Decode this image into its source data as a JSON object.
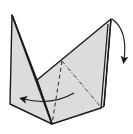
{
  "diagram": {
    "type": "origami-fold-step",
    "colors": {
      "background": "#ffffff",
      "paper_fill": "#dcdcdc",
      "edge_stroke": "#1a1a1a",
      "crease_stroke": "#2a2a2a",
      "arrow_stroke": "#1a1a1a"
    },
    "elements": {
      "left_flap": {
        "points": "12,15 10,104 52,124 37,80"
      },
      "body": {
        "points": "37,80 111,19 104,106 101,108 52,124"
      },
      "right_edge_back": {
        "points": "111,19 104,106"
      },
      "right_edge_front": {
        "points": "108,24 101,108"
      },
      "valley_fold_line": {
        "x1": 62,
        "y1": 61,
        "x2": 52,
        "y2": 124,
        "style": "dashed"
      },
      "mountain_fold_line": {
        "x1": 62,
        "y1": 61,
        "x2": 100,
        "y2": 106,
        "style": "dash-dot"
      },
      "arrow_fold_down": {
        "path": "M 112 19 Q 128 30 124 60",
        "direction": "down"
      },
      "arrow_fold_left": {
        "path": "M 74 93 Q 52 106 23 99",
        "direction": "left"
      }
    }
  }
}
